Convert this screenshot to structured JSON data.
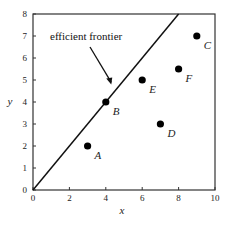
{
  "chart_data": {
    "type": "scatter",
    "title": "",
    "xlabel": "x",
    "ylabel": "y",
    "xlim": [
      0,
      10
    ],
    "ylim": [
      0,
      8
    ],
    "xticks": [
      0,
      2,
      4,
      6,
      8,
      10
    ],
    "yticks": [
      0,
      1,
      2,
      3,
      4,
      5,
      6,
      7,
      8
    ],
    "grid": false,
    "legend": null,
    "points": [
      {
        "label": "A",
        "x": 3,
        "y": 2
      },
      {
        "label": "B",
        "x": 4,
        "y": 4
      },
      {
        "label": "C",
        "x": 9,
        "y": 7
      },
      {
        "label": "D",
        "x": 7,
        "y": 3
      },
      {
        "label": "E",
        "x": 6,
        "y": 5
      },
      {
        "label": "F",
        "x": 8,
        "y": 5.5
      }
    ],
    "lines": [
      {
        "name": "efficient frontier",
        "x": [
          0,
          8
        ],
        "y": [
          0,
          8
        ]
      }
    ],
    "annotations": [
      {
        "text": "efficient frontier",
        "arrow_to": {
          "x": 4.3,
          "y": 4.8
        }
      }
    ]
  },
  "labels": {
    "annotation": "efficient frontier",
    "xlabel": "x",
    "ylabel": "y"
  }
}
